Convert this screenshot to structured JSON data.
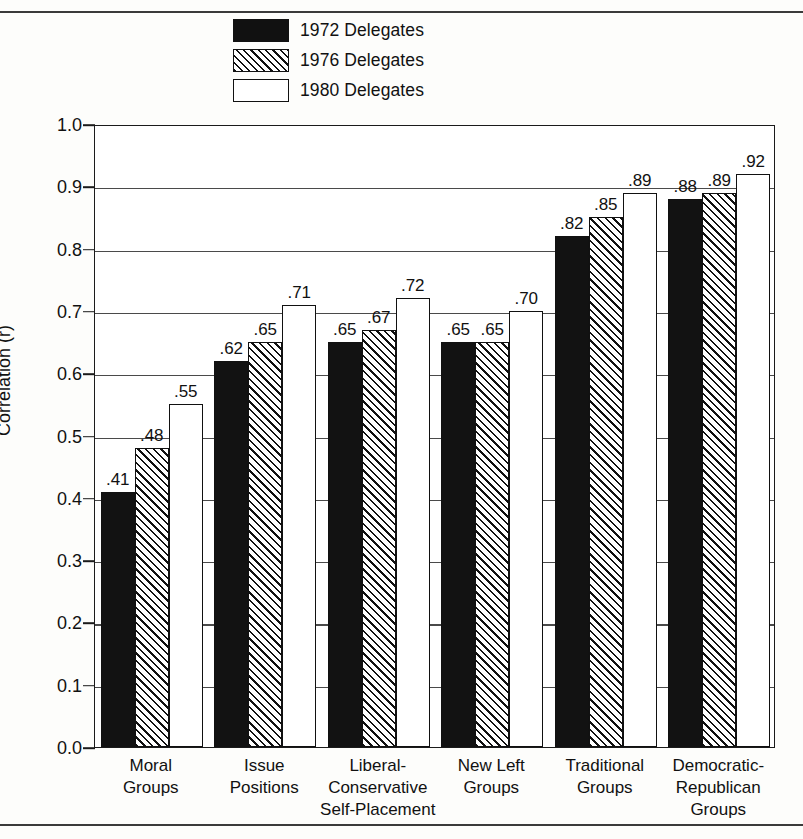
{
  "legend": {
    "items": [
      {
        "label": "1972 Delegates",
        "style": "solid",
        "swatch_name": "legend-swatch-1972"
      },
      {
        "label": "1976 Delegates",
        "style": "hatch",
        "swatch_name": "legend-swatch-1976"
      },
      {
        "label": "1980 Delegates",
        "style": "open",
        "swatch_name": "legend-swatch-1980"
      }
    ]
  },
  "axis": {
    "y_title": "Correlation (r)",
    "y_ticks": [
      "1.0",
      "0.9",
      "0.8",
      "0.7",
      "0.6",
      "0.5",
      "0.4",
      "0.3",
      "0.2",
      "0.1",
      "0.0"
    ]
  },
  "chart_data": {
    "type": "bar",
    "title": "",
    "xlabel": "",
    "ylabel": "Correlation (r)",
    "ylim": [
      0.0,
      1.0
    ],
    "ytick_step": 0.1,
    "grid": true,
    "legend_position": "top-center",
    "categories": [
      "Moral Groups",
      "Issue Positions",
      "Liberal-Conservative Self-Placement",
      "New Left Groups",
      "Traditional Groups",
      "Democratic-Republican Groups"
    ],
    "category_lines": [
      [
        "Moral",
        "Groups"
      ],
      [
        "Issue",
        "Positions"
      ],
      [
        "Liberal-",
        "Conservative",
        "Self-Placement"
      ],
      [
        "New Left",
        "Groups"
      ],
      [
        "Traditional",
        "Groups"
      ],
      [
        "Democratic-",
        "Republican",
        "Groups"
      ]
    ],
    "series": [
      {
        "name": "1972 Delegates",
        "values": [
          0.41,
          0.62,
          0.65,
          0.65,
          0.82,
          0.88
        ],
        "labels": [
          ".41",
          ".62",
          ".65",
          ".65",
          ".82",
          ".88"
        ]
      },
      {
        "name": "1976 Delegates",
        "values": [
          0.48,
          0.65,
          0.67,
          0.65,
          0.85,
          0.89
        ],
        "labels": [
          ".48",
          ".65",
          ".67",
          ".65",
          ".85",
          ".89"
        ]
      },
      {
        "name": "1980 Delegates",
        "values": [
          0.55,
          0.71,
          0.72,
          0.7,
          0.89,
          0.92
        ],
        "labels": [
          ".55",
          ".71",
          ".72",
          ".70",
          ".89",
          ".92"
        ]
      }
    ]
  },
  "colors": {
    "ink": "#111111",
    "grid": "#4a4a4a",
    "background": "#fdfdfb"
  }
}
